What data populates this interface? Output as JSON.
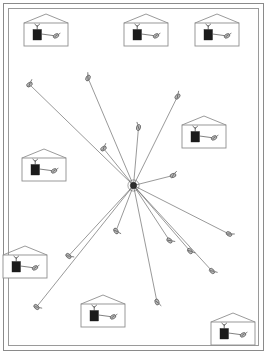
{
  "diagram": {
    "type": "network-topology",
    "canvas": {
      "width": 267,
      "height": 354,
      "background": "#ffffff"
    },
    "frame": {
      "outer": {
        "x": 3,
        "y": 3,
        "width": 261,
        "height": 348,
        "stroke": "#8a8a8a"
      },
      "inner": {
        "x": 8,
        "y": 8,
        "width": 251,
        "height": 338,
        "stroke": "#9a9a9a"
      }
    },
    "hub": {
      "label": "central-access-point",
      "x": 133.5,
      "y": 185.5,
      "radius": 3.2,
      "color": "#2e2e2e"
    },
    "link_style": {
      "stroke": "#5a5a5a",
      "width": 0.62
    },
    "node_style": {
      "body_fill": "#b9b9b9",
      "body_stroke": "#333333",
      "body_rx": 3.1,
      "body_ry": 2.0
    },
    "client_nodes": [
      {
        "id": "node-nw-far",
        "x": 29.5,
        "y": 84.5,
        "angle": -35
      },
      {
        "id": "node-n-upper",
        "x": 88.0,
        "y": 78.0,
        "angle": -62
      },
      {
        "id": "node-n-mid",
        "x": 138.5,
        "y": 127.5,
        "angle": -76
      },
      {
        "id": "node-ne-upper",
        "x": 177.5,
        "y": 96.5,
        "angle": -48
      },
      {
        "id": "node-w-mid",
        "x": 103.5,
        "y": 148.5,
        "angle": -36
      },
      {
        "id": "node-e-mid",
        "x": 173.0,
        "y": 175.5,
        "angle": -20
      },
      {
        "id": "node-se-far",
        "x": 229.0,
        "y": 234.0,
        "angle": 30
      },
      {
        "id": "node-se-mid",
        "x": 169.5,
        "y": 240.5,
        "angle": 40
      },
      {
        "id": "node-se-low",
        "x": 212.0,
        "y": 271.0,
        "angle": 44
      },
      {
        "id": "node-s-mid",
        "x": 116.0,
        "y": 231.0,
        "angle": 58
      },
      {
        "id": "node-sw-mid",
        "x": 68.5,
        "y": 256.0,
        "angle": 40
      },
      {
        "id": "node-sw-far",
        "x": 36.5,
        "y": 307.0,
        "angle": 42
      },
      {
        "id": "node-s-low",
        "x": 157.0,
        "y": 302.0,
        "angle": 72
      },
      {
        "id": "node-s-right",
        "x": 190.0,
        "y": 251.0,
        "angle": 50
      }
    ],
    "houses": [
      {
        "id": "house-top-left",
        "x": 24,
        "y": 14,
        "width": 44,
        "height": 32
      },
      {
        "id": "house-top-center",
        "x": 124,
        "y": 14,
        "width": 44,
        "height": 32
      },
      {
        "id": "house-top-right",
        "x": 195,
        "y": 14,
        "width": 44,
        "height": 32
      },
      {
        "id": "house-right-upper",
        "x": 182,
        "y": 116,
        "width": 44,
        "height": 32
      },
      {
        "id": "house-left-middle",
        "x": 22,
        "y": 149,
        "width": 44,
        "height": 32
      },
      {
        "id": "house-left-lower",
        "x": 3,
        "y": 246,
        "width": 44,
        "height": 32
      },
      {
        "id": "house-bottom-mid",
        "x": 81,
        "y": 295,
        "width": 44,
        "height": 32
      },
      {
        "id": "house-bottom-right",
        "x": 211,
        "y": 313,
        "width": 44,
        "height": 32
      }
    ],
    "house_parts": {
      "device_box": "black-device-box",
      "antenna": "antenna-icon",
      "receiver": "receiver-node-icon",
      "wire": "connection-wire"
    },
    "counts": {
      "client_nodes": 14,
      "houses": 8,
      "links": 14
    }
  }
}
